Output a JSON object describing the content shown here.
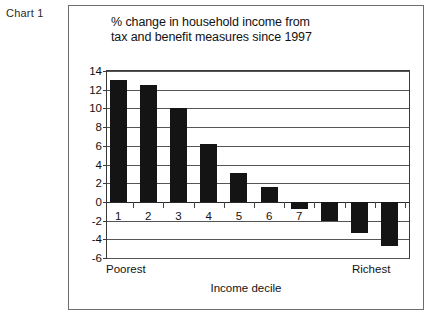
{
  "caption": "Chart 1",
  "chart_data": {
    "type": "bar",
    "title_lines": [
      "% change in household income from",
      "tax and benefit measures since 1997"
    ],
    "title": "% change in household income from tax and benefit measures since 1997",
    "categories": [
      "1",
      "2",
      "3",
      "4",
      "5",
      "6",
      "7",
      "8",
      "9",
      "10"
    ],
    "values": [
      13.0,
      12.5,
      10.0,
      6.2,
      3.1,
      1.6,
      -0.8,
      -2.0,
      -3.3,
      -4.7
    ],
    "xlabel": "Income decile",
    "ylabel": "",
    "ylim": [
      -6,
      14
    ],
    "ytick_labels": [
      "14",
      "12",
      "10",
      "8",
      "6",
      "4",
      "2",
      "0",
      "-2",
      "-4",
      "-6"
    ],
    "ytick_values": [
      14,
      12,
      10,
      8,
      6,
      4,
      2,
      0,
      -2,
      -4,
      -6
    ],
    "grid": true,
    "legend": "none",
    "bar_color": "#141414",
    "axis_color": "#3a3a3a",
    "annotations": {
      "left_end": "Poorest",
      "right_end": "Richest"
    }
  }
}
